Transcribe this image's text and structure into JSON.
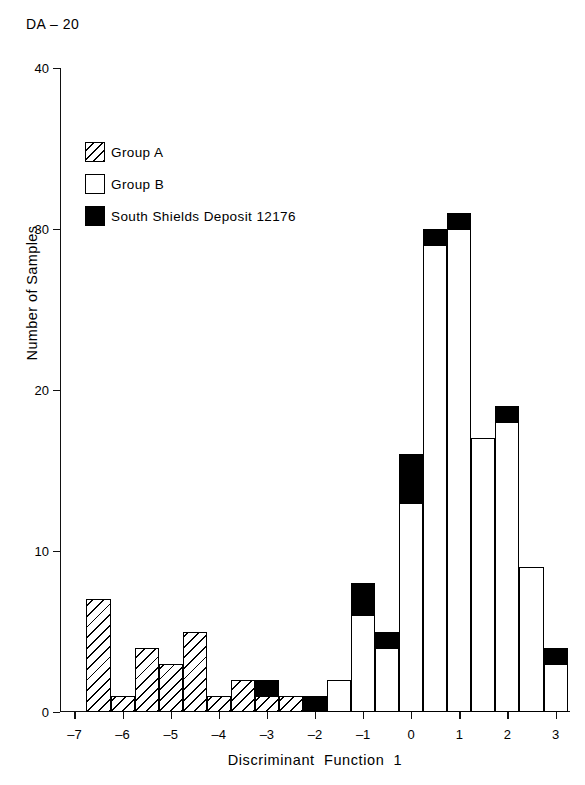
{
  "figure_id": "DA – 20",
  "chart_data": {
    "type": "bar",
    "subtype": "stacked-histogram",
    "title": "DA – 20",
    "xlabel": "Discriminant  Function  1",
    "ylabel": "Number of Samples",
    "xlim": [
      -7.3,
      3.3
    ],
    "ylim": [
      0,
      40
    ],
    "grid": false,
    "bin_width": 0.5,
    "legend_position": "upper-left",
    "xticks": [
      "-7",
      "-6",
      "-5",
      "-4",
      "-3",
      "-2",
      "-1",
      "0",
      "1",
      "2",
      "3"
    ],
    "xtick_values": [
      -7,
      -6,
      -5,
      -4,
      -3,
      -2,
      -1,
      0,
      1,
      2,
      3
    ],
    "yticks": [
      "0",
      "10",
      "20",
      "30",
      "40"
    ],
    "ytick_values": [
      0,
      10,
      20,
      30,
      40
    ],
    "series": [
      {
        "name": "Group A",
        "fill": "hatched",
        "color": "#ffffff"
      },
      {
        "name": "Group B",
        "fill": "open",
        "color": "#ffffff"
      },
      {
        "name": "South Shields Deposit 12176",
        "fill": "solid",
        "color": "#000000"
      }
    ],
    "bins": [
      {
        "x": -6.5,
        "Group A": 7,
        "Group B": 0,
        "South Shields Deposit 12176": 0
      },
      {
        "x": -6.0,
        "Group A": 1,
        "Group B": 0,
        "South Shields Deposit 12176": 0
      },
      {
        "x": -5.5,
        "Group A": 4,
        "Group B": 0,
        "South Shields Deposit 12176": 0
      },
      {
        "x": -5.0,
        "Group A": 3,
        "Group B": 0,
        "South Shields Deposit 12176": 0
      },
      {
        "x": -4.5,
        "Group A": 5,
        "Group B": 0,
        "South Shields Deposit 12176": 0
      },
      {
        "x": -4.0,
        "Group A": 1,
        "Group B": 0,
        "South Shields Deposit 12176": 0
      },
      {
        "x": -3.5,
        "Group A": 2,
        "Group B": 0,
        "South Shields Deposit 12176": 0
      },
      {
        "x": -3.0,
        "Group A": 1,
        "Group B": 0,
        "South Shields Deposit 12176": 1
      },
      {
        "x": -2.5,
        "Group A": 1,
        "Group B": 0,
        "South Shields Deposit 12176": 0
      },
      {
        "x": -2.0,
        "Group A": 0,
        "Group B": 0,
        "South Shields Deposit 12176": 1
      },
      {
        "x": -1.5,
        "Group A": 0,
        "Group B": 2,
        "South Shields Deposit 12176": 0
      },
      {
        "x": -1.0,
        "Group A": 0,
        "Group B": 6,
        "South Shields Deposit 12176": 2
      },
      {
        "x": -0.5,
        "Group A": 0,
        "Group B": 4,
        "South Shields Deposit 12176": 1
      },
      {
        "x": 0.0,
        "Group A": 0,
        "Group B": 13,
        "South Shields Deposit 12176": 3
      },
      {
        "x": 0.5,
        "Group A": 0,
        "Group B": 29,
        "South Shields Deposit 12176": 1
      },
      {
        "x": 1.0,
        "Group A": 0,
        "Group B": 30,
        "South Shields Deposit 12176": 1
      },
      {
        "x": 1.5,
        "Group A": 0,
        "Group B": 17,
        "South Shields Deposit 12176": 0
      },
      {
        "x": 2.0,
        "Group A": 0,
        "Group B": 18,
        "South Shields Deposit 12176": 1
      },
      {
        "x": 2.5,
        "Group A": 0,
        "Group B": 9,
        "South Shields Deposit 12176": 0
      },
      {
        "x": 3.0,
        "Group A": 0,
        "Group B": 3,
        "South Shields Deposit 12176": 1
      }
    ]
  },
  "legend": {
    "items": [
      {
        "label": "Group A",
        "style": "A"
      },
      {
        "label": "Group B",
        "style": "B"
      },
      {
        "label": "South Shields Deposit 12176",
        "style": "S"
      }
    ]
  }
}
